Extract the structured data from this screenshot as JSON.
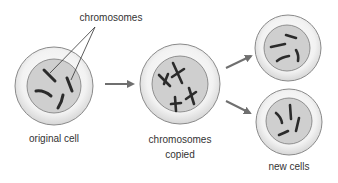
{
  "diagram": {
    "type": "process",
    "labels": {
      "chromosomes_pointer": "chromosomes",
      "original_cell": "original cell",
      "copied_line1": "chromosomes",
      "copied_line2": "copied",
      "new_cells": "new cells"
    },
    "stages": [
      {
        "id": "original-cell",
        "label": "original cell",
        "chromosome_count": 4,
        "chromosome_shape": "single-strand"
      },
      {
        "id": "chromosomes-copied",
        "label": "chromosomes copied",
        "chromosome_count": 4,
        "chromosome_shape": "X-duplicated"
      },
      {
        "id": "new-cell-top",
        "label": "new cells",
        "chromosome_count": 4,
        "chromosome_shape": "single-strand"
      },
      {
        "id": "new-cell-bottom",
        "label": "new cells",
        "chromosome_count": 4,
        "chromosome_shape": "single-strand"
      }
    ],
    "arrows": [
      {
        "from": "original-cell",
        "to": "chromosomes-copied"
      },
      {
        "from": "chromosomes-copied",
        "to": "new-cell-top"
      },
      {
        "from": "chromosomes-copied",
        "to": "new-cell-bottom"
      }
    ],
    "colors": {
      "cell_fill": "#efefef",
      "cell_stroke": "#8a8a8a",
      "nucleus_fill": "#cfcfcf",
      "nucleus_stroke": "#7a7a7a",
      "chromosome": "#2b2b2b",
      "arrow": "#6f6f6f",
      "text": "#333333"
    }
  }
}
